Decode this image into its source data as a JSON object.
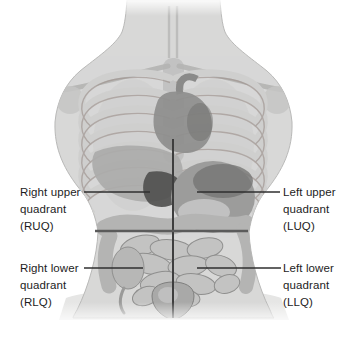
{
  "labels": {
    "ruq": {
      "lines": [
        "Right upper",
        "quadrant",
        "(RUQ)"
      ]
    },
    "luq": {
      "lines": [
        "Left upper",
        "quadrant",
        "(LUQ)"
      ]
    },
    "rlq": {
      "lines": [
        "Right lower",
        "quadrant",
        "(RLQ)"
      ]
    },
    "llq": {
      "lines": [
        "Left lower",
        "quadrant",
        "(LLQ)"
      ]
    }
  },
  "colors": {
    "background": "#ffffff",
    "label_text": "#1d1d1d",
    "leader_line": "#2f2f2f",
    "vertical_midline": "#3e3e3e",
    "horizontal_quadrant_line": "#5b5b5b",
    "skin": "#d8d8d7",
    "skin_halo": "#e6e6e5",
    "bone": "#cfcfce",
    "organ_shadow": "#4f4f4e",
    "organ_mid": "#9c9c9b",
    "intestine": "#c3c3c2"
  },
  "illustration": {
    "parts": [
      "torso",
      "neck",
      "trachea",
      "clavicles",
      "ribcage",
      "sternum",
      "heart",
      "aorta",
      "lungs",
      "liver",
      "gallbladder-region",
      "stomach",
      "transverse-colon",
      "ascending-colon",
      "descending-colon",
      "small-intestine",
      "cecum",
      "appendix",
      "bladder",
      "vertical-midline",
      "horizontal-quadrant-line"
    ]
  }
}
